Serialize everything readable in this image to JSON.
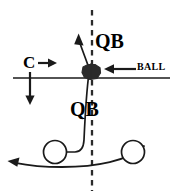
{
  "diagram": {
    "type": "football-play-diagram",
    "colors": {
      "line": "#1a1a1a",
      "ball_fill": "#2b2b2b",
      "background": "#ffffff",
      "dashed_line": "#2b2b2b"
    },
    "labels": {
      "qb_top": "QB",
      "qb_bottom": "QB",
      "ball": "BALL",
      "center": "C"
    },
    "icons": {
      "ball": "football-ball-icon",
      "player_left": "player-circle-icon",
      "player_right": "player-circle-icon",
      "line_of_scrimmage": "line-of-scrimmage-icon",
      "midline": "dashed-midline-icon",
      "qb_up_route": "qb-up-route-arrow-icon",
      "qb_down_route": "qb-down-route-icon",
      "center_right_arrow": "center-right-arrow-icon",
      "center_down_arrow": "center-down-arrow-icon",
      "ball_pointer_arrow": "ball-pointer-arrow-icon",
      "sweep_route": "sweep-route-arrow-icon"
    },
    "elements": [
      {
        "name": "line-of-scrimmage",
        "kind": "horizontal-line",
        "y": 78,
        "x1": 13,
        "x2": 170
      },
      {
        "name": "dashed-midline",
        "kind": "vertical-dashed-line",
        "x": 92,
        "y1": 10,
        "y2": 190
      },
      {
        "name": "ball-marker",
        "kind": "blob",
        "cx": 91,
        "cy": 72,
        "rx": 9,
        "ry": 7
      },
      {
        "name": "player-left",
        "kind": "circle",
        "cx": 55,
        "cy": 152,
        "r": 11
      },
      {
        "name": "player-right",
        "kind": "circle",
        "cx": 133,
        "cy": 152,
        "r": 11
      },
      {
        "name": "center-right-arrow",
        "kind": "arrow",
        "x1": 38,
        "y1": 63,
        "x2": 57,
        "y2": 63
      },
      {
        "name": "center-down-arrow",
        "kind": "arrow",
        "x1": 30,
        "y1": 72,
        "x2": 30,
        "y2": 104
      },
      {
        "name": "ball-pointer-arrow",
        "kind": "arrow",
        "x1": 136,
        "y1": 69,
        "x2": 104,
        "y2": 69
      },
      {
        "name": "qb-up-route",
        "kind": "curved-arrow",
        "from": [
          90,
          72
        ],
        "to": [
          78,
          37
        ]
      },
      {
        "name": "qb-down-route",
        "kind": "curved-path",
        "from": [
          89,
          72
        ],
        "to": [
          66,
          152
        ]
      },
      {
        "name": "sweep-route",
        "kind": "curved-arrow",
        "from": [
          144,
          146
        ],
        "to": [
          8,
          163
        ]
      }
    ]
  }
}
